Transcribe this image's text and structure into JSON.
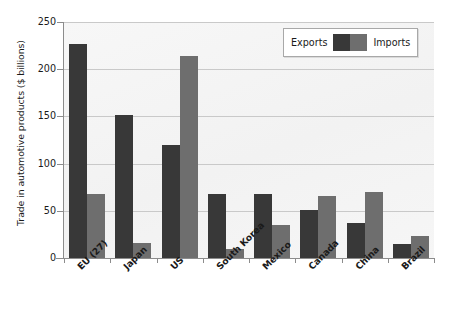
{
  "chart_data": {
    "type": "bar",
    "title": "",
    "xlabel": "",
    "ylabel": "Trade in automotive products ($ billions)",
    "ylim": [
      0,
      250
    ],
    "ytick_labels": [
      "250",
      "200",
      "150",
      "100",
      "50",
      "0"
    ],
    "ytick_values": [
      250,
      200,
      150,
      100,
      50,
      0
    ],
    "grid": true,
    "legend_position": "top-right",
    "categories": [
      "EU (27)",
      "Japan",
      "US",
      "South Korea",
      "Mexico",
      "Canada",
      "China",
      "Brazil"
    ],
    "series": [
      {
        "name": "Exports",
        "color": "#383838",
        "values": [
          227,
          151,
          120,
          68,
          68,
          51,
          37,
          15
        ]
      },
      {
        "name": "Imports",
        "color": "#6e6e6e",
        "values": [
          68,
          16,
          214,
          10,
          35,
          66,
          70,
          23
        ]
      }
    ]
  },
  "legend": {
    "left_label": "Exports",
    "right_label": "Imports"
  },
  "colors": {
    "exports": "#383838",
    "imports": "#6e6e6e",
    "plot_background": "#f4f4f4",
    "gridline": "#c9c9c9",
    "axis": "#8c8c8c"
  }
}
